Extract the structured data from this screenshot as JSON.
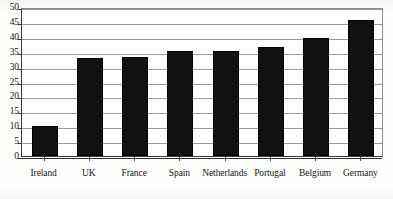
{
  "chart_data": {
    "type": "bar",
    "title": "",
    "subtitle": "",
    "xlabel": "",
    "ylabel": "",
    "categories": [
      "Ireland",
      "UK",
      "France",
      "Spain",
      "Netherlands",
      "Portugal",
      "Belgium",
      "Germany"
    ],
    "values": [
      10,
      33,
      33.2,
      35.3,
      35.4,
      36.5,
      39.5,
      45.5
    ],
    "series": [
      {
        "name": "",
        "values": [
          10,
          33,
          33.2,
          35.3,
          35.4,
          36.5,
          39.5,
          45.5
        ]
      }
    ],
    "ylim": [
      0,
      50
    ],
    "ytick_labels": [
      "0",
      "5",
      "10",
      "15",
      "20",
      "25",
      "30",
      "35",
      "40",
      "45",
      "50"
    ],
    "ytick_values": [
      0,
      5,
      10,
      15,
      20,
      25,
      30,
      35,
      40,
      45,
      50
    ],
    "grid": true,
    "grid_axis": "y",
    "legend": false,
    "legend_position": "none",
    "bar_color": "#111111",
    "gridline_color": "#9a9a9a",
    "axis_color": "#3a3a3a",
    "background_color": "#ffffff"
  }
}
